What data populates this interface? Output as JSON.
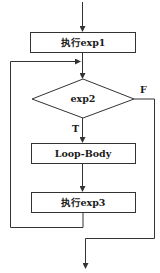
{
  "diagram": {
    "type": "flowchart",
    "nodes": {
      "init": {
        "label": "执行exp1",
        "shape": "rectangle"
      },
      "condition": {
        "label": "exp2",
        "shape": "diamond"
      },
      "body": {
        "label": "Loop-Body",
        "shape": "rectangle"
      },
      "update": {
        "label": "执行exp3",
        "shape": "rectangle"
      }
    },
    "edges": {
      "true_label": "T",
      "false_label": "F"
    },
    "colors": {
      "line": "#333333",
      "background": "#ffffff",
      "text": "#1a1a1a"
    }
  }
}
